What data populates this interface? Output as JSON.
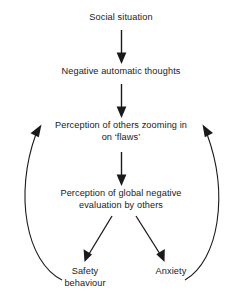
{
  "diagram": {
    "background_color": "#ffffff",
    "line_color": "#1a1a1a",
    "text_color": "#1a1a1a",
    "nodes": [
      {
        "id": "social-situation",
        "label": "Social situation",
        "x": 121,
        "y": 20
      },
      {
        "id": "negative-automatic-thoughts",
        "label": "Negative automatic thoughts",
        "x": 121,
        "y": 74
      },
      {
        "id": "perception-of-others",
        "label": "Perception of others zooming in\non ‘flaws’",
        "x": 121,
        "y": 134
      },
      {
        "id": "perception-global-negative",
        "label": "Perception of global negative\nevaluation by others",
        "x": 121,
        "y": 202
      },
      {
        "id": "safety-behaviour",
        "label": "Safety\nbehaviour",
        "x": 85,
        "y": 280
      },
      {
        "id": "anxiety",
        "label": "Anxiety",
        "x": 171,
        "y": 274
      }
    ],
    "edges": [
      {
        "id": "edge-social-to-thoughts",
        "from": "social-situation",
        "to": "negative-automatic-thoughts",
        "style": "straight",
        "arrowhead": "solid-triangle"
      },
      {
        "id": "edge-thoughts-to-perception-others",
        "from": "negative-automatic-thoughts",
        "to": "perception-of-others",
        "style": "straight",
        "arrowhead": "solid-triangle"
      },
      {
        "id": "edge-perception-others-to-global",
        "from": "perception-of-others",
        "to": "perception-global-negative",
        "style": "straight",
        "arrowhead": "solid-triangle"
      },
      {
        "id": "edge-global-to-safety",
        "from": "perception-global-negative",
        "to": "safety-behaviour",
        "style": "diagonal",
        "arrowhead": "solid-triangle"
      },
      {
        "id": "edge-global-to-anxiety",
        "from": "perception-global-negative",
        "to": "anxiety",
        "style": "diagonal",
        "arrowhead": "solid-triangle"
      },
      {
        "id": "edge-safety-feedback-loop",
        "from": "safety-behaviour",
        "to": "perception-of-others",
        "style": "curved-left",
        "arrowhead": "solid-triangle"
      },
      {
        "id": "edge-anxiety-feedback-loop",
        "from": "anxiety",
        "to": "perception-of-others",
        "style": "curved-right",
        "arrowhead": "solid-triangle"
      }
    ]
  }
}
